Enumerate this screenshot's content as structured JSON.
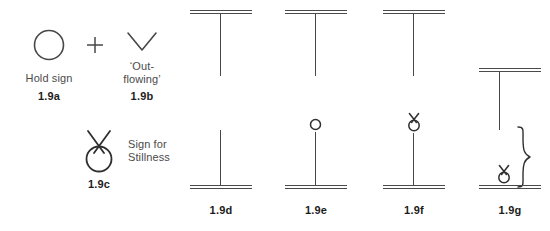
{
  "figure": {
    "id": "1.9",
    "background_color": "#ffffff",
    "ink_color": "#474747",
    "label_color": "#1c1c1c"
  },
  "legend": {
    "items": [
      {
        "key": "1.9a",
        "glyph": "circle",
        "glyph_name": "hold-sign-circle-icon",
        "caption": "Hold sign",
        "label": "1.9a"
      },
      {
        "key": "plus",
        "glyph": "plus",
        "glyph_name": "plus-sign-icon",
        "caption": "",
        "label": ""
      },
      {
        "key": "1.9b",
        "glyph": "chevron-down",
        "glyph_name": "out-flowing-chevron-icon",
        "caption": "‘Out-\nflowing’",
        "label": "1.9b"
      },
      {
        "key": "1.9c",
        "glyph": "stillness",
        "glyph_name": "stillness-sign-icon",
        "caption": "Sign for\nStillness",
        "label": "1.9c"
      }
    ]
  },
  "staves": [
    {
      "key": "1.9d",
      "label": "1.9d",
      "top_rule": true,
      "bottom_rule": true,
      "upper_stem": true,
      "lower_stem": true,
      "upper_symbol": "none",
      "lower_symbol": "none",
      "brace": false
    },
    {
      "key": "1.9e",
      "label": "1.9e",
      "top_rule": true,
      "bottom_rule": true,
      "upper_stem": true,
      "lower_stem": true,
      "upper_symbol": "none",
      "lower_symbol": "circle",
      "brace": false
    },
    {
      "key": "1.9f",
      "label": "1.9f",
      "top_rule": true,
      "bottom_rule": true,
      "upper_stem": true,
      "lower_stem": true,
      "upper_symbol": "none",
      "lower_symbol": "stillness",
      "brace": false
    },
    {
      "key": "1.9g",
      "label": "1.9g",
      "top_rule": true,
      "bottom_rule": true,
      "upper_stem": true,
      "lower_stem": false,
      "upper_symbol": "none",
      "lower_symbol": "stillness",
      "brace": true
    }
  ]
}
